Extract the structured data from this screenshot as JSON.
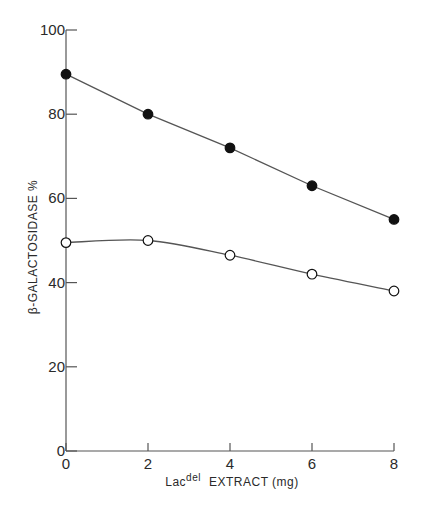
{
  "chart_data": {
    "type": "line",
    "title": "",
    "xlabel": "Lac del EXTRACT (mg)",
    "xlabel_parts": {
      "main": "Lac",
      "sup": "del",
      "rest": "EXTRACT  (mg)"
    },
    "ylabel": "β-GALACTOSIDASE  %",
    "x": [
      0,
      2,
      4,
      6,
      8
    ],
    "xticks": [
      0,
      2,
      4,
      6,
      8
    ],
    "yticks": [
      0,
      20,
      40,
      60,
      80,
      100
    ],
    "xlim": [
      0,
      8
    ],
    "ylim": [
      0,
      100
    ],
    "grid": false,
    "legend": null,
    "series": [
      {
        "name": "filled circles",
        "marker": "filled-circle",
        "smooth": false,
        "values": [
          89.5,
          80,
          72,
          63,
          55
        ]
      },
      {
        "name": "open circles",
        "marker": "open-circle",
        "smooth": true,
        "values": [
          49.5,
          50,
          46.5,
          42,
          38
        ]
      }
    ]
  },
  "colors": {
    "axis": "#555555",
    "line": "#555555",
    "marker": "#111111",
    "background": "#ffffff"
  }
}
